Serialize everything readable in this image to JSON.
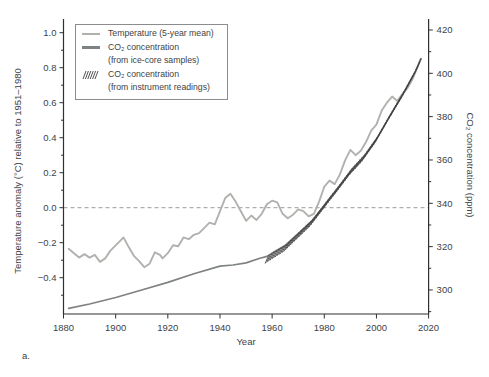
{
  "figure_label": "a.",
  "colors": {
    "temperature_line": "#b1b1ae",
    "co2_line": "#7f8283",
    "hatch": "#3f3f3f",
    "dashed_zero_line": "#9a9a9a",
    "axis": "#2e3133",
    "text": "#3e4245",
    "legend_border": "#8c8c8c",
    "background": "#ffffff"
  },
  "chart_data": {
    "type": "line",
    "title": "",
    "xlabel": "Year",
    "ylabel_left": "Temperature anomaly (°C) relative to 1951–1980",
    "ylabel_right": "CO₂ concentration (ppm)",
    "xlim": [
      1880,
      2020
    ],
    "yleft_lim": [
      -0.6,
      1.08
    ],
    "yright_lim": [
      287,
      425
    ],
    "grid": "off",
    "zero_reference_line": 0.0,
    "legend_position": "upper-left",
    "axes": {
      "x": {
        "label": "Year",
        "ticks": [
          [
            1880,
            "1880"
          ],
          [
            1900,
            "1900"
          ],
          [
            1920,
            "1920"
          ],
          [
            1940,
            "1940"
          ],
          [
            1960,
            "1960"
          ],
          [
            1980,
            "1980"
          ],
          [
            2000,
            "2000"
          ],
          [
            2020,
            "2020"
          ]
        ]
      },
      "left": {
        "label": "Temperature anomaly (°C) relative to 1951–1980",
        "ticks": [
          [
            1.0,
            "1.0"
          ],
          [
            0.8,
            "0.8"
          ],
          [
            0.6,
            "0.6"
          ],
          [
            0.4,
            "0.4"
          ],
          [
            0.2,
            "0.2"
          ],
          [
            0.0,
            "0.0"
          ],
          [
            -0.2,
            "−0.2"
          ],
          [
            -0.4,
            "−0.4"
          ]
        ],
        "minor": [
          0.9,
          0.7,
          0.5,
          0.3,
          0.1,
          -0.1,
          -0.3,
          -0.5
        ]
      },
      "right": {
        "label": "CO₂ concentration (ppm)",
        "ticks": [
          [
            420,
            "420"
          ],
          [
            400,
            "400"
          ],
          [
            380,
            "380"
          ],
          [
            360,
            "360"
          ],
          [
            340,
            "340"
          ],
          [
            320,
            "320"
          ],
          [
            300,
            "300"
          ]
        ],
        "minor": [
          410,
          390,
          370,
          350,
          330,
          310,
          290
        ]
      }
    },
    "legend": [
      {
        "label": "Temperature (5-year mean)",
        "sublabel": "",
        "swatch": "line-light"
      },
      {
        "label": "CO₂ concentration",
        "sublabel": "(from ice-core samples)",
        "swatch": "line-dark"
      },
      {
        "label": "CO₂ concentration",
        "sublabel": "(from instrument readings)",
        "swatch": "hatch"
      }
    ],
    "series": [
      {
        "name": "temperature_5yr_mean",
        "axis": "left",
        "units": "°C",
        "points": [
          [
            1882,
            -0.235
          ],
          [
            1884,
            -0.26
          ],
          [
            1886,
            -0.285
          ],
          [
            1888,
            -0.265
          ],
          [
            1890,
            -0.285
          ],
          [
            1892,
            -0.27
          ],
          [
            1894,
            -0.31
          ],
          [
            1896,
            -0.29
          ],
          [
            1898,
            -0.245
          ],
          [
            1900,
            -0.215
          ],
          [
            1902,
            -0.185
          ],
          [
            1903,
            -0.17
          ],
          [
            1905,
            -0.225
          ],
          [
            1907,
            -0.275
          ],
          [
            1909,
            -0.305
          ],
          [
            1911,
            -0.34
          ],
          [
            1913,
            -0.32
          ],
          [
            1915,
            -0.255
          ],
          [
            1917,
            -0.27
          ],
          [
            1918,
            -0.29
          ],
          [
            1920,
            -0.26
          ],
          [
            1922,
            -0.215
          ],
          [
            1924,
            -0.22
          ],
          [
            1926,
            -0.17
          ],
          [
            1928,
            -0.18
          ],
          [
            1930,
            -0.155
          ],
          [
            1932,
            -0.145
          ],
          [
            1934,
            -0.115
          ],
          [
            1936,
            -0.085
          ],
          [
            1938,
            -0.095
          ],
          [
            1940,
            -0.02
          ],
          [
            1942,
            0.055
          ],
          [
            1944,
            0.08
          ],
          [
            1946,
            0.035
          ],
          [
            1948,
            -0.02
          ],
          [
            1950,
            -0.075
          ],
          [
            1952,
            -0.045
          ],
          [
            1954,
            -0.07
          ],
          [
            1956,
            -0.035
          ],
          [
            1958,
            0.02
          ],
          [
            1960,
            0.04
          ],
          [
            1962,
            0.03
          ],
          [
            1964,
            -0.035
          ],
          [
            1966,
            -0.06
          ],
          [
            1968,
            -0.04
          ],
          [
            1970,
            -0.01
          ],
          [
            1972,
            -0.02
          ],
          [
            1974,
            -0.05
          ],
          [
            1976,
            -0.035
          ],
          [
            1978,
            0.035
          ],
          [
            1980,
            0.12
          ],
          [
            1982,
            0.155
          ],
          [
            1984,
            0.135
          ],
          [
            1986,
            0.19
          ],
          [
            1988,
            0.27
          ],
          [
            1990,
            0.33
          ],
          [
            1992,
            0.3
          ],
          [
            1994,
            0.325
          ],
          [
            1996,
            0.375
          ],
          [
            1998,
            0.44
          ],
          [
            2000,
            0.475
          ],
          [
            2002,
            0.555
          ],
          [
            2004,
            0.6
          ],
          [
            2006,
            0.635
          ],
          [
            2008,
            0.61
          ],
          [
            2010,
            0.65
          ],
          [
            2012,
            0.685
          ],
          [
            2014,
            0.74
          ],
          [
            2016,
            0.815
          ],
          [
            2017,
            0.85
          ]
        ]
      },
      {
        "name": "co2_ice_core",
        "axis": "right",
        "units": "ppm",
        "points": [
          [
            1882,
            291.5
          ],
          [
            1890,
            293.5
          ],
          [
            1900,
            296.5
          ],
          [
            1910,
            300
          ],
          [
            1920,
            303.5
          ],
          [
            1930,
            307.5
          ],
          [
            1940,
            311
          ],
          [
            1945,
            311.5
          ],
          [
            1950,
            312.5
          ],
          [
            1955,
            314.5
          ],
          [
            1958,
            315.5
          ],
          [
            1960,
            317
          ],
          [
            1965,
            320.5
          ],
          [
            1970,
            326
          ],
          [
            1975,
            331.5
          ],
          [
            1980,
            339
          ],
          [
            1985,
            346.5
          ],
          [
            1990,
            354.5
          ],
          [
            1995,
            361
          ],
          [
            2000,
            369.5
          ],
          [
            2005,
            380
          ],
          [
            2010,
            390
          ],
          [
            2015,
            401
          ],
          [
            2017,
            406.5
          ]
        ]
      },
      {
        "name": "co2_instrument_readings",
        "axis": "right",
        "units": "ppm",
        "style": "hatch",
        "year_start": 1958,
        "year_end": 2017,
        "values_follow": "co2_ice_core"
      }
    ]
  }
}
